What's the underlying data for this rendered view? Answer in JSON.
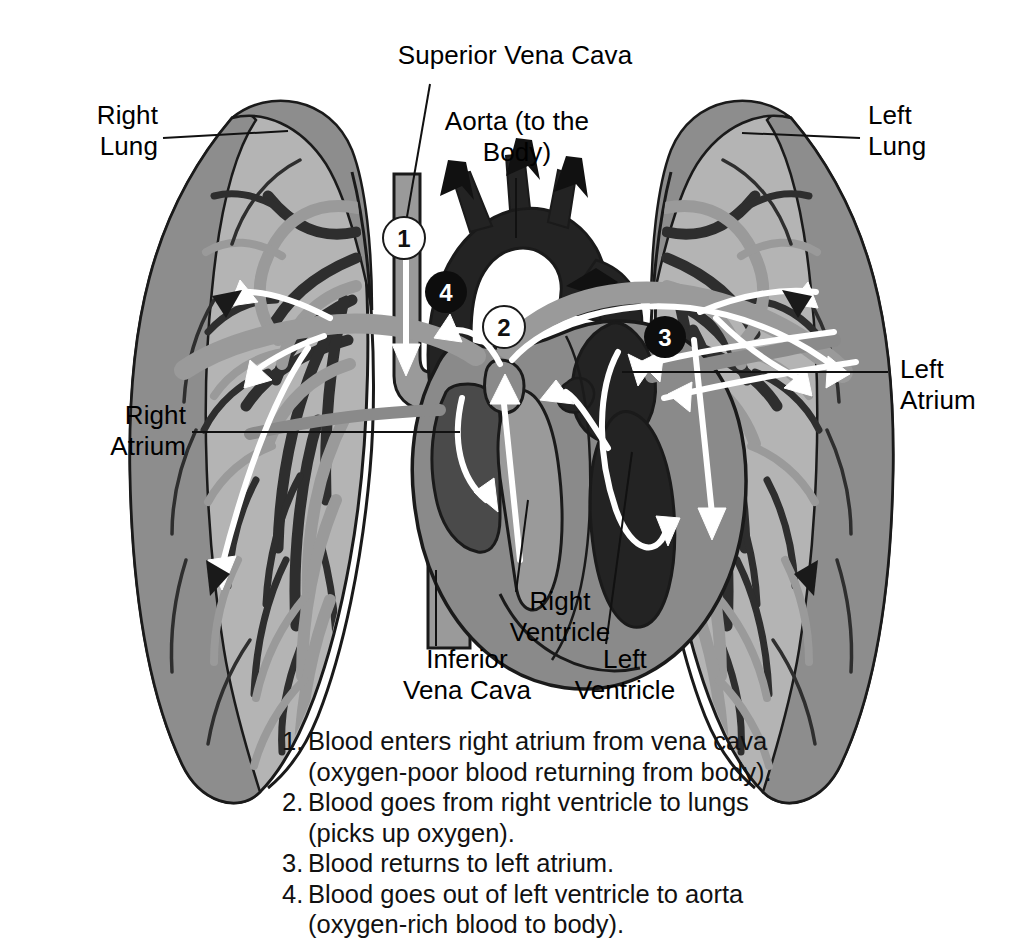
{
  "diagram": {
    "labels": {
      "right_lung": "Right\nLung",
      "left_lung": "Left\nLung",
      "superior_vena_cava": "Superior Vena Cava",
      "aorta": "Aorta (to the\nBody)",
      "right_atrium": "Right\nAtrium",
      "left_atrium": "Left\nAtrium",
      "right_ventricle": "Right\nVentricle",
      "left_ventricle": "Left\nVentricle",
      "inferior_vena_cava": "Inferior\nVena Cava"
    },
    "markers": [
      {
        "number": "1",
        "style": "white",
        "x": 404,
        "y": 238
      },
      {
        "number": "2",
        "style": "white",
        "x": 504,
        "y": 327
      },
      {
        "number": "3",
        "style": "black",
        "x": 665,
        "y": 337
      },
      {
        "number": "4",
        "style": "black",
        "x": 446,
        "y": 292
      }
    ],
    "caption": [
      {
        "num": "1.",
        "line1": "Blood enters right atrium from vena cava",
        "line2": "(oxygen-poor blood returning from body)."
      },
      {
        "num": "2.",
        "line1": "Blood goes from right ventricle to lungs",
        "line2": "(picks up oxygen)."
      },
      {
        "num": "3.",
        "line1": "Blood returns to left atrium.",
        "line2": ""
      },
      {
        "num": "4.",
        "line1": "Blood goes out of left ventricle to aorta",
        "line2": "(oxygen-rich blood to body)."
      }
    ],
    "colors": {
      "background": "#ffffff",
      "lung_fill": "#b4b4b4",
      "lung_rim": "#8d8d8d",
      "heart_muscle": "#8a8a8a",
      "chamber_dark": "#4a4a4a",
      "deoxy_dark": "#2a2a2a",
      "vessel_mid": "#9a9a9a",
      "vessel_dark": "#313131",
      "outline": "#1a1a1a",
      "flow_arrow_oxy": "#ffffff",
      "flow_arrow_deoxy": "#111111"
    }
  }
}
